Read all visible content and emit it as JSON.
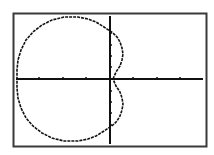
{
  "chart_data": {
    "type": "line",
    "title": "",
    "xlabel": "",
    "ylabel": "",
    "grid": false,
    "axes": {
      "x_ticks_px": [
        39,
        63,
        86,
        133,
        157,
        180
      ],
      "origin_px": [
        110,
        79
      ]
    },
    "series": [
      {
        "name": "curve",
        "points_px": [
          [
            113,
            79
          ],
          [
            116,
            72
          ],
          [
            120,
            66
          ],
          [
            122,
            60
          ],
          [
            123,
            54
          ],
          [
            122,
            48
          ],
          [
            120,
            42
          ],
          [
            117,
            37
          ],
          [
            113,
            33
          ],
          [
            110,
            31
          ],
          [
            104,
            27
          ],
          [
            96,
            22
          ],
          [
            88,
            19
          ],
          [
            78,
            17
          ],
          [
            64,
            17
          ],
          [
            52,
            20
          ],
          [
            42,
            25
          ],
          [
            33,
            32
          ],
          [
            26,
            40
          ],
          [
            21,
            50
          ],
          [
            18,
            60
          ],
          [
            17,
            70
          ],
          [
            17,
            79
          ],
          [
            17,
            88
          ],
          [
            18,
            98
          ],
          [
            21,
            108
          ],
          [
            26,
            118
          ],
          [
            33,
            126
          ],
          [
            42,
            133
          ],
          [
            52,
            138
          ],
          [
            64,
            141
          ],
          [
            78,
            141
          ],
          [
            88,
            139
          ],
          [
            96,
            136
          ],
          [
            104,
            131
          ],
          [
            110,
            127
          ],
          [
            113,
            125
          ],
          [
            117,
            121
          ],
          [
            120,
            116
          ],
          [
            122,
            110
          ],
          [
            123,
            104
          ],
          [
            122,
            98
          ],
          [
            120,
            92
          ],
          [
            116,
            86
          ],
          [
            113,
            79
          ]
        ]
      }
    ]
  },
  "screen": {
    "frame_color": "#3a3a3a",
    "curve_color": "#111111",
    "axis_color": "#111111",
    "background": "#ffffff"
  }
}
